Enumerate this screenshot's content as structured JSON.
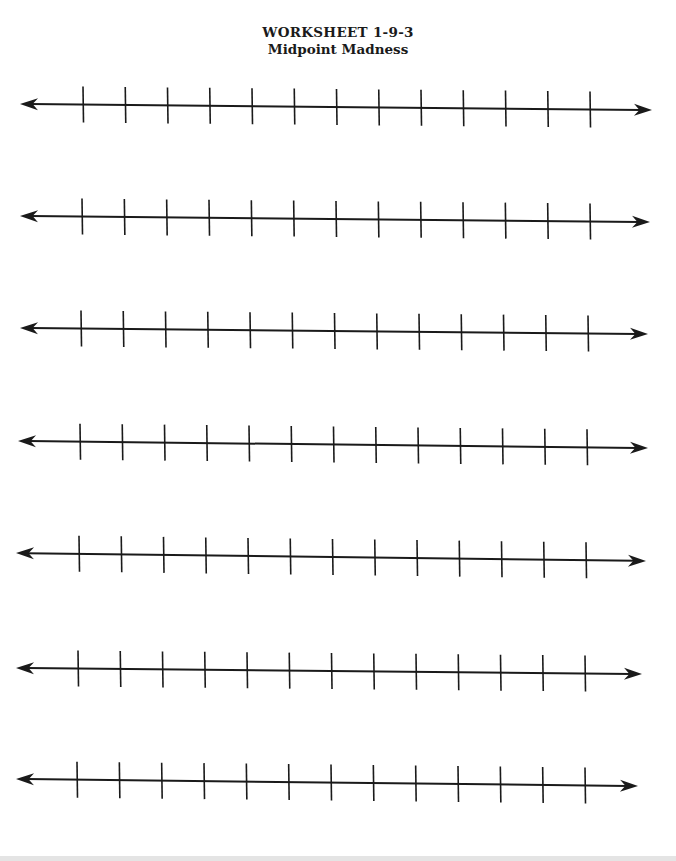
{
  "worksheet": {
    "title": "WORKSHEET 1-9-3",
    "subtitle": "Midpoint Madness"
  },
  "number_lines": {
    "count": 7,
    "ticks_per_line": 13,
    "tick_half_height": 18,
    "stroke_color": "#1a1a1a",
    "lines": [
      {
        "x1": 20,
        "y1": 104,
        "x2": 652,
        "y2": 110,
        "tick_start": 83,
        "tick_end": 590
      },
      {
        "x1": 20,
        "y1": 216,
        "x2": 650,
        "y2": 222,
        "tick_start": 82,
        "tick_end": 590
      },
      {
        "x1": 20,
        "y1": 328,
        "x2": 648,
        "y2": 334,
        "tick_start": 81,
        "tick_end": 588
      },
      {
        "x1": 18,
        "y1": 441,
        "x2": 648,
        "y2": 448,
        "tick_start": 80,
        "tick_end": 587
      },
      {
        "x1": 16,
        "y1": 553,
        "x2": 646,
        "y2": 561,
        "tick_start": 79,
        "tick_end": 586
      },
      {
        "x1": 16,
        "y1": 668,
        "x2": 642,
        "y2": 674,
        "tick_start": 78,
        "tick_end": 585
      },
      {
        "x1": 16,
        "y1": 779,
        "x2": 638,
        "y2": 786,
        "tick_start": 77,
        "tick_end": 585
      }
    ]
  }
}
